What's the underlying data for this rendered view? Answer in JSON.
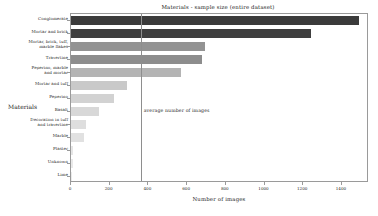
{
  "chart_data": {
    "type": "bar",
    "orientation": "horizontal",
    "title": "Materials - sample size (entire dataset)",
    "xlabel": "Number of images",
    "ylabel": "Materials",
    "xlim": [
      0,
      1540
    ],
    "ylim": [
      0,
      13
    ],
    "grid": false,
    "legend": null,
    "xticks": [
      0,
      200,
      400,
      600,
      800,
      1000,
      1200,
      1400
    ],
    "xtick_labels": [
      "0",
      "200",
      "400",
      "600",
      "800",
      "1000",
      "1200",
      "1400"
    ],
    "categories": [
      "Conglomerate",
      "Mortar and brick",
      "Mortar, brick, tuff,\nmarble flakes",
      "Travertine",
      "Peperino, marble\nand mortar",
      "Mortar and tuff",
      "Peperino",
      "Basalt",
      "Decoration in tuff\nand travertine",
      "Marble",
      "Plaster",
      "Unknown",
      "Lime"
    ],
    "values": [
      1490,
      1240,
      690,
      675,
      570,
      290,
      220,
      145,
      75,
      65,
      12,
      8,
      5
    ],
    "bar_colors": [
      "#3b3b3b",
      "#3f3f3f",
      "#939393",
      "#8d8d8d",
      "#b4b4b4",
      "#c9c9c9",
      "#d2d2d2",
      "#d8d8d8",
      "#dedede",
      "#e1e1e1",
      "#e6e6e6",
      "#e9e9e9",
      "#ebebeb"
    ],
    "annotations": [
      {
        "name": "average-line",
        "label": "average number of images",
        "x_value": 360
      }
    ]
  }
}
